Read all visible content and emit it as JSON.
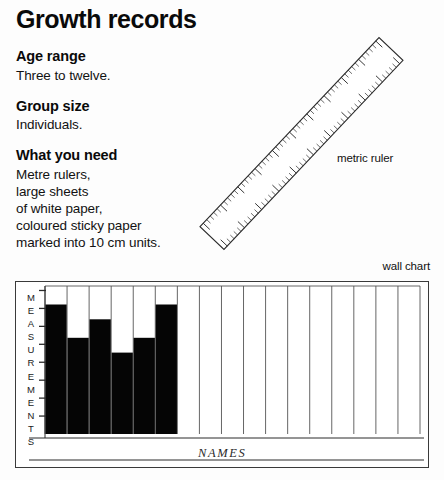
{
  "page": {
    "title": "Growth records",
    "background_color": "#fdfdfd",
    "ink_color": "#111111"
  },
  "sections": [
    {
      "heading": "Age range",
      "lines": [
        "Three to twelve."
      ]
    },
    {
      "heading": "Group size",
      "lines": [
        "Individuals."
      ]
    },
    {
      "heading": "What you need",
      "lines": [
        "Metre rulers,",
        "large sheets",
        "of white paper,",
        "coloured sticky paper",
        "marked into 10 cm units."
      ]
    }
  ],
  "illustrations": {
    "ruler": {
      "label": "metric ruler",
      "icon": "ruler-icon",
      "major_ticks": 11,
      "minor_ticks_per_major": 5
    },
    "wall_chart": {
      "label": "wall chart",
      "icon": "bar-chart-icon"
    }
  },
  "chart_data": {
    "type": "bar",
    "title": "wall chart",
    "xlabel": "NAMES",
    "ylabel": "MEASUREMENTS",
    "ylabel_letters": [
      "M",
      "E",
      "A",
      "S",
      "U",
      "R",
      "E",
      "M",
      "E",
      "N",
      "T",
      "S"
    ],
    "grid": true,
    "legend": "none",
    "bar_color": "#050505",
    "axis_color": "#1a1a1a",
    "columns_total": 17,
    "axis_ticks": 8,
    "ylim": [
      0,
      8
    ],
    "categories": [
      "1",
      "2",
      "3",
      "4",
      "5",
      "6",
      "7",
      "8",
      "9",
      "10",
      "11",
      "12",
      "13",
      "14",
      "15",
      "16",
      "17"
    ],
    "values": [
      7,
      5.2,
      6.2,
      4.4,
      5.2,
      7,
      0,
      0,
      0,
      0,
      0,
      0,
      0,
      0,
      0,
      0,
      0
    ]
  }
}
